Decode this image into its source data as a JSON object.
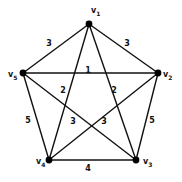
{
  "diagram": {
    "type": "weighted-complete-graph",
    "vertices": [
      {
        "id": "v1",
        "name": "v",
        "sub": "1",
        "x": 89,
        "y": 24,
        "lx": 91,
        "ly": 13
      },
      {
        "id": "v2",
        "name": "v",
        "sub": "2",
        "x": 158,
        "y": 73,
        "lx": 163,
        "ly": 77
      },
      {
        "id": "v3",
        "name": "v",
        "sub": "3",
        "x": 136,
        "y": 160,
        "lx": 143,
        "ly": 164
      },
      {
        "id": "v4",
        "name": "v",
        "sub": "4",
        "x": 49,
        "y": 160,
        "lx": 36,
        "ly": 164
      },
      {
        "id": "v5",
        "name": "v",
        "sub": "5",
        "x": 23,
        "y": 73,
        "lx": 8,
        "ly": 77
      }
    ],
    "edges": [
      {
        "from": "v1",
        "to": "v5",
        "weight": "3",
        "lx": 49,
        "ly": 46
      },
      {
        "from": "v1",
        "to": "v2",
        "weight": "3",
        "lx": 127,
        "ly": 46
      },
      {
        "from": "v5",
        "to": "v2",
        "weight": "1",
        "lx": 88,
        "ly": 73
      },
      {
        "from": "v1",
        "to": "v4",
        "weight": "2",
        "lx": 63,
        "ly": 93
      },
      {
        "from": "v1",
        "to": "v3",
        "weight": "2",
        "lx": 114,
        "ly": 93
      },
      {
        "from": "v5",
        "to": "v3",
        "weight": "3",
        "lx": 73,
        "ly": 124
      },
      {
        "from": "v2",
        "to": "v4",
        "weight": "3",
        "lx": 104,
        "ly": 124
      },
      {
        "from": "v5",
        "to": "v4",
        "weight": "5",
        "lx": 28,
        "ly": 123
      },
      {
        "from": "v2",
        "to": "v3",
        "weight": "5",
        "lx": 152,
        "ly": 123
      },
      {
        "from": "v4",
        "to": "v3",
        "weight": "4",
        "lx": 88,
        "ly": 171
      }
    ]
  }
}
